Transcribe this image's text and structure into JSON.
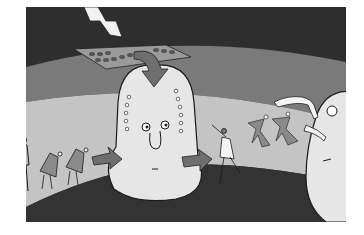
{
  "image": {
    "description": "Grayscale cartoon illustration: a large pear-shaped head figure with dotted sides sits in a curved tunnel; a zigzag arrow hits a tray of dots above it, a curved arrow points down into the head, small hunched figures walk in from the left, and dancing figures move toward a second large round head on the right.",
    "palette": {
      "dark": "#2e2e2e",
      "band_mid": "#7a7a7a",
      "tunnel_light": "#c4c4c4",
      "head_fill": "#e6e6e6",
      "arrow_gray": "#6e6e6e",
      "figure_gray": "#8a8a8a",
      "outline": "#1a1a1a"
    }
  }
}
